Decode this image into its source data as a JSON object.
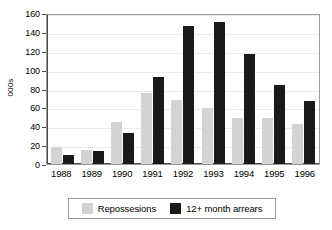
{
  "chart_data": {
    "type": "bar",
    "title": "",
    "subtitle": "",
    "xlabel": "",
    "ylabel": "000s",
    "ylim": [
      0,
      160
    ],
    "ytick_step": 20,
    "yticks": [
      160,
      140,
      120,
      100,
      80,
      60,
      40,
      20,
      0
    ],
    "grid": true,
    "legend_position": "bottom",
    "categories": [
      "1988",
      "1989",
      "1990",
      "1991",
      "1992",
      "1993",
      "1994",
      "1995",
      "1996"
    ],
    "series": [
      {
        "name": "Repossesions",
        "color": "#d3d3d3",
        "values": [
          18,
          15,
          44,
          75,
          68,
          59,
          49,
          49,
          42
        ]
      },
      {
        "name": "12+ month arrears",
        "color": "#1a1a1a",
        "values": [
          10,
          13.5,
          33,
          92,
          146,
          150,
          117,
          84,
          67
        ]
      }
    ]
  },
  "axes": {
    "y_title": "000s"
  },
  "legend": {
    "items": [
      {
        "label": "Repossesions",
        "swatch": "legend-swatch-repossesions"
      },
      {
        "label": "12+ month arrears",
        "swatch": "legend-swatch-arrears"
      }
    ]
  }
}
